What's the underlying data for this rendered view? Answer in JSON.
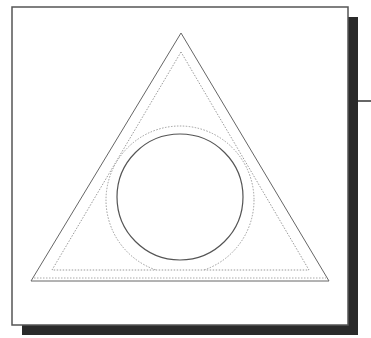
{
  "diagram": {
    "colors": {
      "background": "#ffffff",
      "frame_stroke": "#555555",
      "shadow": "#2a2a2a",
      "outer_triangle_stroke": "#666666",
      "dotted_stroke": "#9a9a9a",
      "circle_stroke": "#555555",
      "connector_line": "#333333"
    },
    "frame": {
      "x": 12,
      "y": 7,
      "width": 336,
      "height": 318
    },
    "shadow": {
      "offset_x": 10,
      "offset_y": 10
    },
    "outer_triangle": {
      "points": [
        [
          181,
          33
        ],
        [
          31,
          281
        ],
        [
          329,
          281
        ]
      ]
    },
    "inner_dotted_triangle": {
      "points": [
        [
          181,
          52
        ],
        [
          52,
          270
        ],
        [
          309,
          270
        ]
      ]
    },
    "outer_bottom_dotted_line": {
      "y": 278,
      "x1": 34,
      "x2": 326
    },
    "solid_circle": {
      "cx": 180,
      "cy": 197,
      "r": 63
    },
    "dotted_circle": {
      "cx": 180,
      "cy": 200,
      "r": 74
    },
    "connector_line": {
      "y": 101,
      "x1": 358,
      "x2": 371
    }
  }
}
